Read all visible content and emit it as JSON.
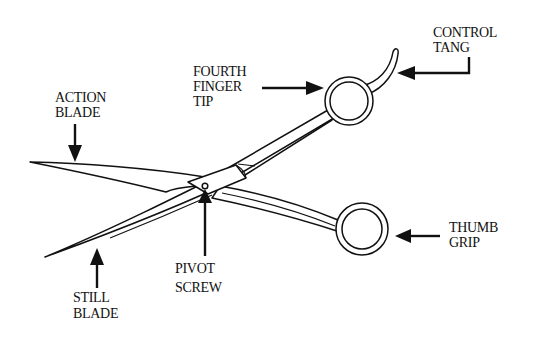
{
  "diagram": {
    "labels": {
      "action_blade": {
        "line1": "ACTION",
        "line2": "BLADE"
      },
      "fourth_finger_tip": {
        "line1": "FOURTH",
        "line2": "FINGER",
        "line3": "TIP"
      },
      "control_tang": {
        "line1": "CONTROL",
        "line2": "TANG"
      },
      "thumb_grip": {
        "line1": "THUMB",
        "line2": "GRIP"
      },
      "pivot_screw": {
        "line1": "PIVOT",
        "line2": "SCREW"
      },
      "still_blade": {
        "line1": "STILL",
        "line2": "BLADE"
      }
    },
    "colors": {
      "ink": "#111111",
      "background": "#ffffff"
    }
  }
}
